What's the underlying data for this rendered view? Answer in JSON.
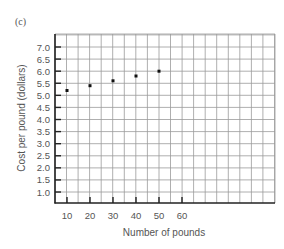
{
  "panel_label": "(c)",
  "chart_data": {
    "type": "scatter",
    "title": "",
    "xlabel": "Number of pounds",
    "ylabel": "Cost per pound (dollars)",
    "x_ticks": [
      "10",
      "20",
      "30",
      "40",
      "50",
      "60"
    ],
    "y_ticks": [
      "7.0",
      "6.5",
      "6.0",
      "5.5",
      "5.0",
      "4.5",
      "4.0",
      "3.5",
      "3.0",
      "2.5",
      "2.0",
      "1.5",
      "1.0"
    ],
    "x": [
      10,
      20,
      30,
      40,
      50
    ],
    "y": [
      5.2,
      5.4,
      5.6,
      5.8,
      6.0
    ],
    "series": [
      {
        "name": "Cost per pound",
        "points": [
          [
            10,
            5.2
          ],
          [
            20,
            5.4
          ],
          [
            30,
            5.6
          ],
          [
            40,
            5.8
          ],
          [
            50,
            6.0
          ]
        ]
      }
    ],
    "xlim": [
      5,
      100
    ],
    "ylim": [
      0.5,
      7.5
    ],
    "grid": true,
    "legend": null
  }
}
